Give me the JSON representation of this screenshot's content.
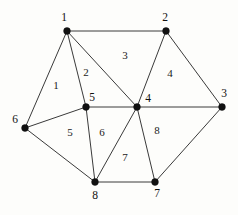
{
  "figure": {
    "background_color": "#fdfdfb",
    "edge_color": "#3a3a3a",
    "vertex_color": "#111111",
    "label_color": "#1a1a1a",
    "width": 238,
    "height": 215
  },
  "chart_data": {
    "type": "diagram",
    "subtype": "undirected-planar-graph",
    "title": "",
    "vertices": [
      {
        "id": "v1",
        "label": "1",
        "x": 67,
        "y": 31,
        "label_x": 64,
        "label_y": 18
      },
      {
        "id": "v2",
        "label": "2",
        "x": 166,
        "y": 31,
        "label_x": 165,
        "label_y": 18
      },
      {
        "id": "v3",
        "label": "3",
        "x": 222,
        "y": 107,
        "label_x": 224,
        "label_y": 94
      },
      {
        "id": "v4",
        "label": "4",
        "x": 137,
        "y": 107,
        "label_x": 148,
        "label_y": 99
      },
      {
        "id": "v5",
        "label": "5",
        "x": 86,
        "y": 107,
        "label_x": 92,
        "label_y": 98
      },
      {
        "id": "v6",
        "label": "6",
        "x": 25,
        "y": 128,
        "label_x": 15,
        "label_y": 120
      },
      {
        "id": "v7",
        "label": "7",
        "x": 155,
        "y": 182,
        "label_x": 157,
        "label_y": 194
      },
      {
        "id": "v8",
        "label": "8",
        "x": 95,
        "y": 182,
        "label_x": 95,
        "label_y": 196
      }
    ],
    "edges": [
      {
        "from": "v1",
        "to": "v2"
      },
      {
        "from": "v1",
        "to": "v6"
      },
      {
        "from": "v1",
        "to": "v5"
      },
      {
        "from": "v1",
        "to": "v4"
      },
      {
        "from": "v2",
        "to": "v4"
      },
      {
        "from": "v2",
        "to": "v3"
      },
      {
        "from": "v3",
        "to": "v4"
      },
      {
        "from": "v3",
        "to": "v7"
      },
      {
        "from": "v4",
        "to": "v5"
      },
      {
        "from": "v4",
        "to": "v8"
      },
      {
        "from": "v4",
        "to": "v7"
      },
      {
        "from": "v5",
        "to": "v6"
      },
      {
        "from": "v5",
        "to": "v8"
      },
      {
        "from": "v6",
        "to": "v8"
      },
      {
        "from": "v7",
        "to": "v8"
      }
    ],
    "faces": [
      {
        "id": "f1",
        "label": "1",
        "x": 56,
        "y": 85,
        "boundary": [
          "v1",
          "v6",
          "v5"
        ]
      },
      {
        "id": "f2",
        "label": "2",
        "x": 86,
        "y": 72,
        "boundary": [
          "v1",
          "v5",
          "v4"
        ]
      },
      {
        "id": "f3",
        "label": "3",
        "x": 125,
        "y": 55,
        "boundary": [
          "v1",
          "v2",
          "v4"
        ]
      },
      {
        "id": "f4",
        "label": "4",
        "x": 170,
        "y": 73,
        "boundary": [
          "v2",
          "v3",
          "v4"
        ]
      },
      {
        "id": "f5",
        "label": "5",
        "x": 70,
        "y": 132,
        "boundary": [
          "v5",
          "v6",
          "v8"
        ]
      },
      {
        "id": "f6",
        "label": "6",
        "x": 102,
        "y": 132,
        "boundary": [
          "v5",
          "v4",
          "v8"
        ]
      },
      {
        "id": "f7",
        "label": "7",
        "x": 125,
        "y": 157,
        "boundary": [
          "v4",
          "v7",
          "v8"
        ]
      },
      {
        "id": "f8",
        "label": "8",
        "x": 157,
        "y": 130,
        "boundary": [
          "v4",
          "v3",
          "v7"
        ]
      }
    ],
    "vertex_count": 8,
    "edge_count": 15,
    "face_count": 8
  }
}
